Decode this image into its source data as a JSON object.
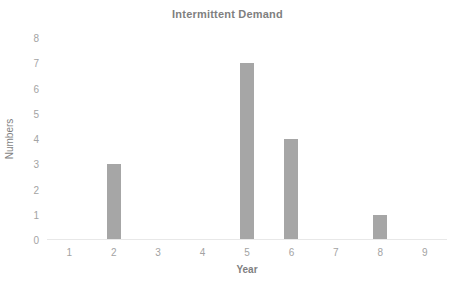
{
  "chart_data": {
    "type": "bar",
    "title": "Intermittent Demand",
    "xlabel": "Year",
    "ylabel": "Numbers",
    "categories": [
      1,
      2,
      3,
      4,
      5,
      6,
      7,
      8,
      9
    ],
    "values": [
      0,
      3,
      0,
      0,
      7,
      4,
      0,
      1,
      0
    ],
    "series": [
      {
        "name": "Numbers",
        "values": [
          0,
          3,
          0,
          0,
          7,
          4,
          0,
          1,
          0
        ]
      }
    ],
    "x_tick_labels": [
      "1",
      "2",
      "3",
      "4",
      "5",
      "6",
      "7",
      "8",
      "9"
    ],
    "y_tick_labels": [
      "0",
      "1",
      "2",
      "3",
      "4",
      "5",
      "6",
      "7",
      "8"
    ],
    "y_ticks": [
      0,
      1,
      2,
      3,
      4,
      5,
      6,
      7,
      8
    ],
    "ylim": [
      0,
      8
    ],
    "xlim": [
      0.5,
      9.5
    ],
    "grid": false,
    "legend": false,
    "bar_color": "#a6a6a6",
    "text_color": "#7f7f7f",
    "tick_color": "#a3a3a3",
    "axis_line_color": "#e8e8e8",
    "background_color": "#ffffff"
  }
}
